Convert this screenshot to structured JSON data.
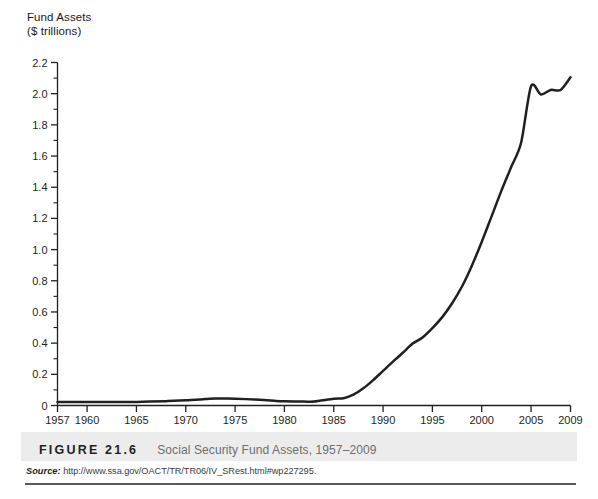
{
  "figure": {
    "label": "FIGURE 21.6",
    "caption": "Social Security Fund Assets, 1957–2009",
    "source_label": "Source:",
    "source_url": "http://www.ssa.gov/OACT/TR/TR06/IV_SRest.html#wp227295."
  },
  "colors": {
    "line": "#231f20",
    "axis": "#231f20",
    "caption_band": "#ececec",
    "caption_text": "#6d6e71",
    "rule": "#5a5a5a",
    "background": "#ffffff"
  },
  "chart_data": {
    "type": "line",
    "title": "Social Security Fund Assets, 1957–2009",
    "xlabel": "",
    "ylabel": "Fund Assets ($ trillions)",
    "ylabel_line1": "Fund Assets",
    "ylabel_line2": "($ trillions)",
    "xlim": [
      1957,
      2009
    ],
    "ylim": [
      0,
      2.2
    ],
    "grid": false,
    "legend": false,
    "y_major_step": 0.2,
    "y_minor_step": 0.1,
    "yticks": [
      "0",
      "0.2",
      "0.4",
      "0.6",
      "0.8",
      "1.0",
      "1.2",
      "1.4",
      "1.6",
      "1.8",
      "2.0",
      "2.2"
    ],
    "ytick_values": [
      0,
      0.2,
      0.4,
      0.6,
      0.8,
      1.0,
      1.2,
      1.4,
      1.6,
      1.8,
      2.0,
      2.2
    ],
    "y_minor_values": [
      0.1,
      0.3,
      0.5,
      0.7,
      0.9,
      1.1,
      1.3,
      1.5,
      1.7,
      1.9,
      2.1
    ],
    "xticks": [
      "1957",
      "1960",
      "1965",
      "1970",
      "1975",
      "1980",
      "1985",
      "1990",
      "1995",
      "2000",
      "2005",
      "2009"
    ],
    "xtick_values": [
      1957,
      1960,
      1965,
      1970,
      1975,
      1980,
      1985,
      1990,
      1995,
      2000,
      2005,
      2009
    ],
    "series": [
      {
        "name": "Social Security Fund Assets",
        "x": [
          1957,
          1960,
          1962,
          1965,
          1968,
          1970,
          1972,
          1973,
          1974,
          1975,
          1977,
          1979,
          1980,
          1982,
          1983,
          1985,
          1986,
          1987,
          1988,
          1989,
          1990,
          1991,
          1992,
          1993,
          1994,
          1995,
          1996,
          1997,
          1998,
          1999,
          2000,
          2001,
          2002,
          2003,
          2004,
          2005,
          2006,
          2007,
          2008,
          2009
        ],
        "values": [
          0.023,
          0.023,
          0.022,
          0.023,
          0.028,
          0.033,
          0.041,
          0.045,
          0.045,
          0.044,
          0.038,
          0.03,
          0.027,
          0.025,
          0.025,
          0.043,
          0.047,
          0.069,
          0.11,
          0.163,
          0.222,
          0.281,
          0.338,
          0.397,
          0.436,
          0.496,
          0.567,
          0.656,
          0.763,
          0.897,
          1.049,
          1.213,
          1.378,
          1.531,
          1.687,
          2.048,
          1.995,
          2.024,
          2.024,
          2.105
        ]
      }
    ],
    "annotations": []
  }
}
